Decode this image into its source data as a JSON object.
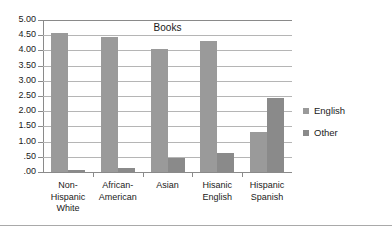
{
  "chart_data": {
    "type": "bar",
    "title": "Books",
    "xlabel": "",
    "ylabel": "",
    "ylim": [
      0,
      5
    ],
    "grid": true,
    "legend_position": "right",
    "ytick_labels": [
      "5.00",
      "4.50",
      "4.00",
      "3.50",
      "3.00",
      "2.50",
      "2.00",
      "1.50",
      "1.00",
      ".50",
      ".00"
    ],
    "ytick_values": [
      5.0,
      4.5,
      4.0,
      3.5,
      3.0,
      2.5,
      2.0,
      1.5,
      1.0,
      0.5,
      0.0
    ],
    "categories": [
      "Non-\nHispanic\nWhite",
      "African-\nAmerican",
      "Asian",
      "Hisanic\nEnglish",
      "Hispanic\nSpanish"
    ],
    "category_lines": [
      [
        "Non-",
        "Hispanic",
        "White"
      ],
      [
        "African-",
        "American"
      ],
      [
        "Asian"
      ],
      [
        "Hisanic",
        "English"
      ],
      [
        "Hispanic",
        "Spanish"
      ]
    ],
    "series": [
      {
        "name": "English",
        "color": "#9a9a9a",
        "values": [
          4.57,
          4.44,
          4.04,
          4.32,
          1.32
        ]
      },
      {
        "name": "Other",
        "color": "#8a8a8a",
        "values": [
          0.07,
          0.14,
          0.46,
          0.61,
          2.42
        ]
      }
    ]
  },
  "legend": {
    "entries": [
      {
        "label": "English",
        "swatch": "english-swatch"
      },
      {
        "label": "Other",
        "swatch": "other-swatch"
      }
    ]
  },
  "colors": {
    "series_english": "#9a9a9a",
    "series_other": "#8a8a8a",
    "gridline": "#b5b5b5",
    "axis": "#8a8a8a",
    "background": "#ffffff",
    "text": "#1a1a1a"
  }
}
